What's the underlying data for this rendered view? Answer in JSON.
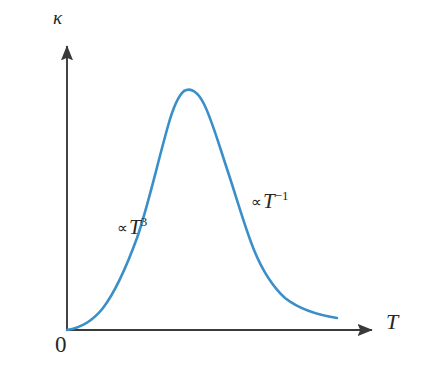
{
  "figure": {
    "name": "thermal-conductivity-vs-temperature",
    "background_color": "#ffffff"
  },
  "axes": {
    "y_label": "κ",
    "x_label": "T",
    "origin_label": "0",
    "axis_color": "#3a3a3a",
    "x_axis": {
      "start_x": 67,
      "end_x": 378,
      "y": 330
    },
    "y_axis": {
      "x": 67,
      "start_y": 330,
      "end_y": 40
    }
  },
  "annotations": [
    {
      "name": "low-temperature-regime",
      "prop_sign": "∝",
      "variable": "T",
      "exponent": "3",
      "full_text": "∝T³"
    },
    {
      "name": "high-temperature-regime",
      "prop_sign": "∝",
      "variable": "T",
      "exponent": "−1",
      "full_text": "∝T⁻¹"
    }
  ],
  "curve": {
    "name": "thermal-conductivity-curve",
    "color": "#3a8fc8",
    "stroke_width": 2.6,
    "path": "M 67 330 C 80 328 92 322 103 308 C 116 291 126 268 137 238 C 148 206 157 165 168 126 C 173 108 178 96 184 91 C 191 87 198 92 204 104 C 212 120 219 145 228 172 C 237 199 245 228 254 250 C 263 272 273 287 285 298 C 299 309 318 315 337 318"
  },
  "chart_data": {
    "type": "line",
    "title": "",
    "xlabel": "T",
    "ylabel": "κ",
    "grid": false,
    "legend": "none",
    "xlim": [
      0,
      1
    ],
    "ylim": [
      0,
      1
    ],
    "annotations": [
      "∝T³",
      "∝T⁻¹"
    ],
    "series": [
      {
        "name": "thermal conductivity",
        "color": "#3a8fc8",
        "x": [
          0.0,
          0.05,
          0.1,
          0.15,
          0.2,
          0.25,
          0.3,
          0.35,
          0.38,
          0.4,
          0.43,
          0.46,
          0.5,
          0.55,
          0.6,
          0.65,
          0.7,
          0.75,
          0.8,
          0.87,
          0.94,
          1.0
        ],
        "y": [
          0.0,
          0.03,
          0.08,
          0.17,
          0.32,
          0.52,
          0.73,
          0.9,
          0.97,
          1.0,
          1.0,
          0.97,
          0.88,
          0.74,
          0.6,
          0.48,
          0.37,
          0.29,
          0.22,
          0.14,
          0.08,
          0.04
        ]
      }
    ]
  }
}
